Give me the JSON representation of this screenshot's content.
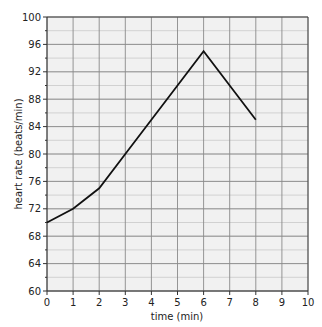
{
  "chart_data": {
    "type": "line",
    "title": "",
    "xlabel": "time (min)",
    "ylabel": "heart rate (beats/min)",
    "xlim": [
      0,
      10
    ],
    "ylim": [
      60,
      100
    ],
    "x_ticks": [
      0,
      1,
      2,
      3,
      4,
      5,
      6,
      7,
      8,
      9,
      10
    ],
    "y_ticks": [
      60,
      64,
      68,
      72,
      76,
      80,
      84,
      88,
      92,
      96,
      100
    ],
    "grid": true,
    "grid_minor_y_step": 2,
    "legend": null,
    "series": [
      {
        "name": "heart rate",
        "x": [
          0,
          1,
          2,
          3,
          4,
          5,
          6,
          7,
          8
        ],
        "values": [
          70,
          72,
          75,
          80,
          85,
          90,
          95,
          90,
          85
        ],
        "color": "#111111"
      }
    ]
  },
  "colors": {
    "plot_background": "#f1f1f1",
    "grid_major": "#8a8a8a",
    "grid_minor": "#c9c9c9",
    "line": "#111111",
    "axis": "#333333"
  }
}
